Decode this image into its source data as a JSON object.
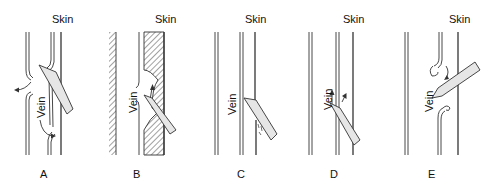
{
  "figure": {
    "panels": [
      {
        "id": "A",
        "label": "A",
        "skin_label": "Skin",
        "vein_label": "Vein",
        "description": "Needle passes through vein, blood leaks both sides"
      },
      {
        "id": "B",
        "label": "B",
        "skin_label": "Skin",
        "vein_label": "Vein",
        "description": "Needle bevel partially in vein, hematoma in tissue"
      },
      {
        "id": "C",
        "label": "C",
        "skin_label": "Skin",
        "vein_label": "Vein",
        "description": "Needle not yet in vein"
      },
      {
        "id": "D",
        "label": "D",
        "skin_label": "Skin",
        "vein_label": "Vein",
        "description": "Needle bevel partially in vein"
      },
      {
        "id": "E",
        "label": "E",
        "skin_label": "Skin",
        "vein_label": "Vein",
        "description": "Needle through both vein walls"
      }
    ]
  },
  "colors": {
    "line": "#333333",
    "needle_fill": "#e6e6e6",
    "hatch": "#444444",
    "background": "#ffffff"
  }
}
